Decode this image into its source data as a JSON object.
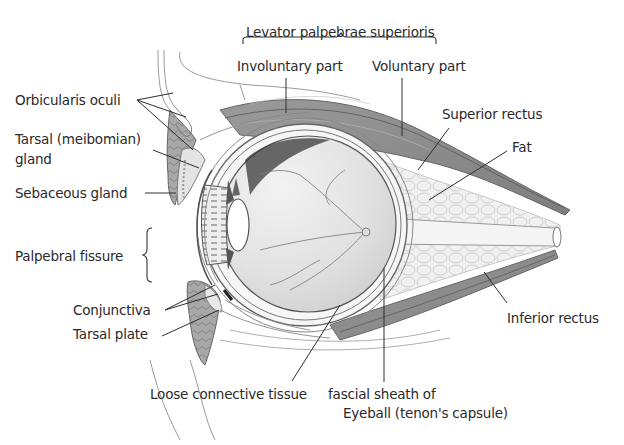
{
  "diagram": {
    "colors": {
      "background": "#ffffff",
      "text": "#2a2a2a",
      "leader_line": "#333333",
      "muscle": "#8a8a8a",
      "tissue_light": "#e6e6e6"
    },
    "labels": {
      "levator": "Levator palpebrae superioris",
      "involuntary": "Involuntary part",
      "voluntary": "Voluntary part",
      "orbicularis": "Orbicularis oculi",
      "tarsal_gland_1": "Tarsal (meibomian)",
      "tarsal_gland_2": "gland",
      "sebaceous": "Sebaceous gland",
      "palpebral": "Palpebral fissure",
      "conjunctiva": "Conjunctiva",
      "tarsal_plate": "Tarsal plate",
      "loose_tissue": "Loose connective tissue",
      "fascial_1": "fascial sheath of",
      "fascial_2": "Eyeball (tenon's capsule)",
      "superior_rectus": "Superior rectus",
      "fat": "Fat",
      "inferior_rectus": "Inferior rectus"
    }
  }
}
